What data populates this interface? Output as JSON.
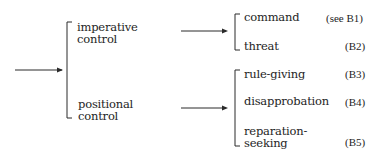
{
  "diagram": {
    "type": "hierarchical-bracket-classification",
    "root_arrow": {
      "target": "level1"
    },
    "level1": [
      {
        "label_lines": [
          "imperative",
          "control"
        ]
      },
      {
        "label_lines": [
          "positional",
          "control"
        ]
      }
    ],
    "level2_groups": [
      {
        "parent": "imperative control",
        "items": [
          {
            "label_lines": [
              "command"
            ],
            "ref": "(see B1)"
          },
          {
            "label_lines": [
              "threat"
            ],
            "ref": "(B2)"
          }
        ]
      },
      {
        "parent": "positional control",
        "items": [
          {
            "label_lines": [
              "rule-giving"
            ],
            "ref": "(B3)"
          },
          {
            "label_lines": [
              "disapprobation"
            ],
            "ref": "(B4)"
          },
          {
            "label_lines": [
              "reparation-",
              "seeking"
            ],
            "ref": "(B5)"
          }
        ]
      }
    ],
    "colors": {
      "line": "#2a2a2a",
      "text": "#1e1e1e",
      "background": "#ffffff"
    }
  }
}
